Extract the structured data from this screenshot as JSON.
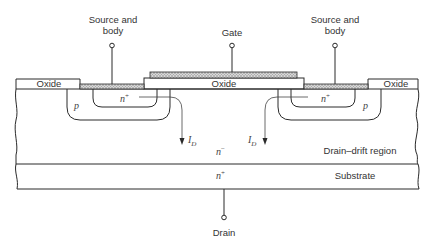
{
  "figure": {
    "terminals": {
      "source_left": {
        "line1": "Source and",
        "line2": "body"
      },
      "gate": "Gate",
      "source_right": {
        "line1": "Source and",
        "line2": "body"
      },
      "drain": "Drain"
    },
    "layers": {
      "oxide_left": "Oxide",
      "oxide_center": "Oxide",
      "oxide_right": "Oxide",
      "drift_region": "Drain–drift region",
      "substrate": "Substrate"
    },
    "doping": {
      "p_left": "p",
      "nplus_left": "n",
      "nplus_left_sup": "+",
      "nplus_right": "n",
      "nplus_right_sup": "+",
      "p_right": "p",
      "nminus": "n",
      "nminus_sup": "−",
      "nplus_sub": "n",
      "nplus_sub_sup": "+"
    },
    "currents": {
      "left": {
        "symbol": "I",
        "sub": "D"
      },
      "right": {
        "symbol": "I",
        "sub": "D"
      }
    },
    "colors": {
      "line": "#2a2a2a",
      "metal_hatch": "#9a9a9a",
      "background": "#ffffff"
    }
  }
}
